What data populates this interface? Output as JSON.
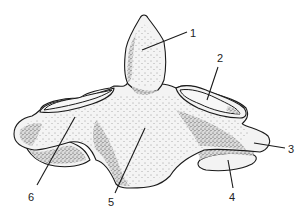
{
  "figure": {
    "background": "#ffffff",
    "ink": "#1a1a1a",
    "labels": [
      {
        "id": "1",
        "text": "1",
        "x": 190,
        "y": 37,
        "pointer": {
          "x1": 142,
          "y1": 50,
          "x2": 187,
          "y2": 32
        }
      },
      {
        "id": "2",
        "text": "2",
        "x": 218,
        "y": 63,
        "pointer": {
          "x1": 207,
          "y1": 100,
          "x2": 218,
          "y2": 67
        }
      },
      {
        "id": "3",
        "text": "3",
        "x": 288,
        "y": 153,
        "pointer": {
          "x1": 254,
          "y1": 143,
          "x2": 285,
          "y2": 148
        }
      },
      {
        "id": "4",
        "text": "4",
        "x": 229,
        "y": 201,
        "pointer": {
          "x1": 228,
          "y1": 160,
          "x2": 233,
          "y2": 188
        }
      },
      {
        "id": "5",
        "text": "5",
        "x": 108,
        "y": 206,
        "pointer": {
          "x1": 145,
          "y1": 128,
          "x2": 115,
          "y2": 193
        }
      },
      {
        "id": "6",
        "text": "6",
        "x": 28,
        "y": 201,
        "pointer": {
          "x1": 75,
          "y1": 117,
          "x2": 37,
          "y2": 185
        }
      }
    ]
  }
}
